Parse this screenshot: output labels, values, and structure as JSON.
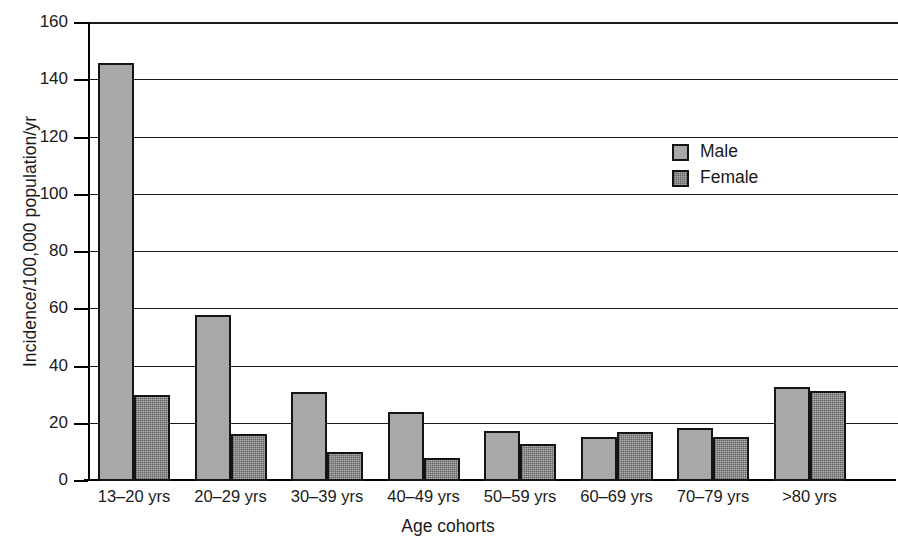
{
  "chart_data": {
    "type": "bar",
    "title": "",
    "xlabel": "Age cohorts",
    "ylabel": "Incidence/100,000 population/yr",
    "categories": [
      "13–20 yrs",
      "20–29 yrs",
      "30–39 yrs",
      "40–49 yrs",
      "50–59 yrs",
      "60–69 yrs",
      "70–79 yrs",
      ">80 yrs"
    ],
    "series": [
      {
        "name": "Male",
        "values": [
          146,
          58,
          31,
          24,
          17.5,
          15.5,
          18.5,
          33
        ]
      },
      {
        "name": "Female",
        "values": [
          30,
          16.5,
          10,
          8,
          13,
          17,
          15.5,
          31.5
        ]
      }
    ],
    "ylim": [
      0,
      160
    ],
    "yticks": [
      0,
      20,
      40,
      60,
      80,
      100,
      120,
      140,
      160
    ],
    "ytick_labels": [
      "0",
      "20",
      "40",
      "60",
      "80",
      "100",
      "120",
      "140",
      "160"
    ],
    "grid": "horizontal",
    "legend_position": "upper-right",
    "colors": {
      "male_fill": "#a8a8a8",
      "female_fill": "#b4b4b4",
      "bar_edge": "#141414",
      "axis": "#000000",
      "gridline": "#1a1a1a",
      "text": "#1a1a1a",
      "background": "#ffffff"
    }
  }
}
